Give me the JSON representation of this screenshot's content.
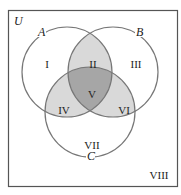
{
  "diagram": {
    "type": "venn-3-sets",
    "universe_label": "U",
    "sets": [
      {
        "label": "A",
        "cx": 67,
        "cy": 72,
        "r": 45
      },
      {
        "label": "B",
        "cx": 113,
        "cy": 72,
        "r": 45
      },
      {
        "label": "C",
        "cx": 90,
        "cy": 112,
        "r": 45
      }
    ],
    "regions": [
      {
        "id": "I",
        "label": "I"
      },
      {
        "id": "II",
        "label": "II"
      },
      {
        "id": "III",
        "label": "III"
      },
      {
        "id": "IV",
        "label": "IV"
      },
      {
        "id": "V",
        "label": "V"
      },
      {
        "id": "VI",
        "label": "VI"
      },
      {
        "id": "VII",
        "label": "VII"
      },
      {
        "id": "VIII",
        "label": "VIII"
      }
    ],
    "colors": {
      "outline": "#777777",
      "frame": "#555555",
      "pairwise_fill": "#d9d9d9",
      "triple_fill": "#a6a6a6",
      "background": "#ffffff"
    }
  }
}
